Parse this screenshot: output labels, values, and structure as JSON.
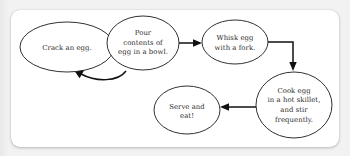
{
  "diagram": {
    "background_color": "#f2f2f2",
    "card_color": "#ffffff",
    "stroke_color": "#1a1a1a",
    "text_color": "#2b2b2b",
    "nodes": [
      {
        "id": "crack",
        "name": "crack-an-egg",
        "shape": "ellipse",
        "cx": 67,
        "cy": 47,
        "rx": 47,
        "ry": 25,
        "lines": [
          "Crack an egg."
        ]
      },
      {
        "id": "pour",
        "name": "pour-contents",
        "shape": "ellipse",
        "cx": 143,
        "cy": 43,
        "rx": 36,
        "ry": 27,
        "lines": [
          "Pour",
          "contents of",
          "egg in a bowl."
        ]
      },
      {
        "id": "whisk",
        "name": "whisk-egg",
        "shape": "ellipse",
        "cx": 235,
        "cy": 42,
        "rx": 33,
        "ry": 22,
        "lines": [
          "Whisk egg",
          "with a fork."
        ]
      },
      {
        "id": "cook",
        "name": "cook-egg",
        "shape": "ellipse",
        "cx": 294,
        "cy": 105,
        "rx": 38,
        "ry": 33,
        "lines": [
          "Cook egg",
          "in a hot skillet,",
          "and stir",
          "frequently."
        ]
      },
      {
        "id": "serve",
        "name": "serve-and-eat",
        "shape": "ellipse",
        "cx": 187,
        "cy": 110,
        "rx": 33,
        "ry": 24,
        "lines": [
          "Serve and",
          "eat!"
        ]
      }
    ],
    "connectors": [
      {
        "id": "c1",
        "name": "arrow-crack-to-pour",
        "type": "straight",
        "from": "crack",
        "to": "pour"
      },
      {
        "id": "c2",
        "name": "arrow-pour-to-whisk",
        "type": "straight",
        "from": "pour",
        "to": "whisk"
      },
      {
        "id": "c3",
        "name": "arrow-whisk-to-cook",
        "type": "elbow",
        "from": "whisk",
        "to": "cook"
      },
      {
        "id": "c4",
        "name": "arrow-cook-to-serve",
        "type": "straight",
        "from": "cook",
        "to": "serve"
      },
      {
        "id": "c5",
        "name": "arrow-pour-back-to-crack",
        "type": "curved",
        "from": "pour",
        "to": "crack"
      }
    ]
  }
}
